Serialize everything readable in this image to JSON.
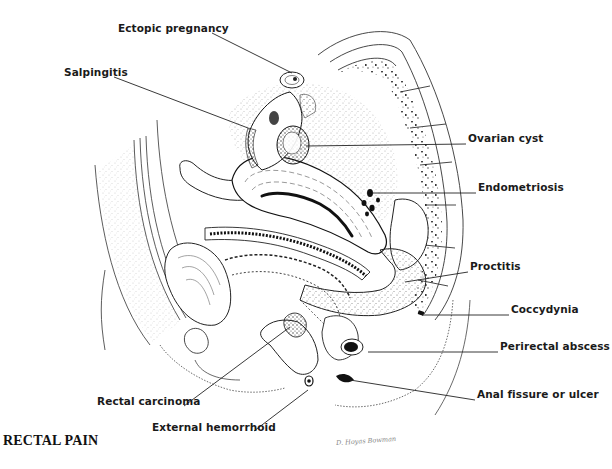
{
  "figure": {
    "title": "RECTAL PAIN",
    "signature": "D. Hoyas Bowman",
    "labels": [
      {
        "id": "ectopic-pregnancy",
        "text": "Ectopic pregnancy",
        "x": 118,
        "y": 27
      },
      {
        "id": "salpingitis",
        "text": "Salpingitis",
        "x": 64,
        "y": 71
      },
      {
        "id": "ovarian-cyst",
        "text": "Ovarian cyst",
        "x": 468,
        "y": 137
      },
      {
        "id": "endometriosis",
        "text": "Endometriosis",
        "x": 478,
        "y": 186
      },
      {
        "id": "proctitis",
        "text": "Proctitis",
        "x": 470,
        "y": 265
      },
      {
        "id": "coccydynia",
        "text": "Coccydynia",
        "x": 511,
        "y": 308
      },
      {
        "id": "perirectal-abscess",
        "text": "Perirectal abscess",
        "x": 500,
        "y": 345
      },
      {
        "id": "anal-fissure-or-ulcer",
        "text": "Anal fissure or ulcer",
        "x": 477,
        "y": 393
      },
      {
        "id": "rectal-carcinoma",
        "text": "Rectal carcinoma",
        "x": 97,
        "y": 400
      },
      {
        "id": "external-hemorrhoid",
        "text": "External hemorrhoid",
        "x": 152,
        "y": 426
      }
    ],
    "leaders": [
      {
        "id": "ectopic-pregnancy",
        "x1": 212,
        "y1": 33,
        "x2": 292,
        "y2": 73
      },
      {
        "id": "salpingitis",
        "x1": 114,
        "y1": 77,
        "x2": 248,
        "y2": 128
      },
      {
        "id": "ovarian-cyst",
        "x1": 306,
        "y1": 146,
        "x2": 466,
        "y2": 144
      },
      {
        "id": "endometriosis",
        "x1": 372,
        "y1": 193,
        "x2": 476,
        "y2": 193
      },
      {
        "id": "proctitis",
        "x1": 405,
        "y1": 282,
        "x2": 468,
        "y2": 272
      },
      {
        "id": "coccydynia",
        "x1": 422,
        "y1": 315,
        "x2": 509,
        "y2": 315
      },
      {
        "id": "perirectal-abscess",
        "x1": 368,
        "y1": 352,
        "x2": 498,
        "y2": 352
      },
      {
        "id": "anal-fissure-or-ulcer",
        "x1": 350,
        "y1": 380,
        "x2": 475,
        "y2": 400
      },
      {
        "id": "rectal-carcinoma",
        "x1": 290,
        "y1": 327,
        "x2": 184,
        "y2": 406
      },
      {
        "id": "external-hemorrhoid",
        "x1": 308,
        "y1": 390,
        "x2": 254,
        "y2": 431
      }
    ]
  },
  "colors": {
    "ink": "#1a1a1a",
    "stipple": "#555555",
    "background": "#ffffff"
  }
}
